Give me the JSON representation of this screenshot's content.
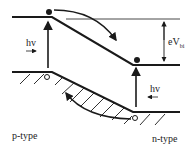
{
  "diagram": {
    "labels": {
      "hv_left": "hv",
      "hv_right": "hv",
      "barrier": "eV",
      "barrier_sub": "bi",
      "p_side": "p-type",
      "n_side": "n-type"
    },
    "colors": {
      "line": "#1a1a1a",
      "background": "#ffffff"
    }
  }
}
